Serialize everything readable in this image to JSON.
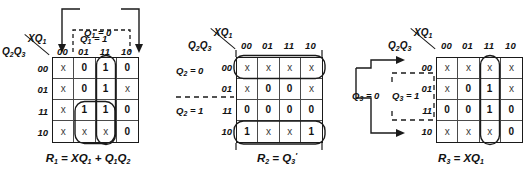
{
  "figure": {
    "col_header_label": "XQ1",
    "row_header_label": "Q2Q3",
    "column_codes": [
      "00",
      "01",
      "11",
      "10"
    ],
    "row_codes": [
      "00",
      "01",
      "11",
      "10"
    ]
  },
  "maps": [
    {
      "id": "kmap-1",
      "name": "R1",
      "corner_top": "XQ",
      "corner_top_sub": "1",
      "corner_bottom": "Q",
      "corner_bottom_subs": "2Q3",
      "columns": [
        "00",
        "01",
        "11",
        "10"
      ],
      "rows": [
        "00",
        "01",
        "11",
        "10"
      ],
      "cells": [
        [
          "x",
          "0",
          "1",
          "0"
        ],
        [
          "x",
          "0",
          "1",
          "x"
        ],
        [
          "x",
          "1",
          "1",
          "0"
        ],
        [
          "x",
          "x",
          "x",
          "0"
        ]
      ],
      "equation": "R1 = XQ1 + Q1Q2",
      "annotations": {
        "top_solid_label": "Q1 = 0",
        "top_dashed_label": "Q1 = 1"
      },
      "groups": [
        {
          "name": "group-column-11",
          "cols": [
            2,
            2
          ],
          "rows": [
            0,
            3
          ]
        },
        {
          "name": "group-row-11-10-cols-01-11",
          "cols": [
            1,
            2
          ],
          "rows": [
            2,
            3
          ]
        }
      ]
    },
    {
      "id": "kmap-2",
      "name": "R2",
      "corner_top": "XQ",
      "corner_top_sub": "1",
      "corner_bottom": "Q",
      "corner_bottom_subs": "2Q3",
      "columns": [
        "00",
        "01",
        "11",
        "10"
      ],
      "rows": [
        "00",
        "01",
        "11",
        "10"
      ],
      "cells": [
        [
          "x",
          "x",
          "x",
          "x"
        ],
        [
          "x",
          "0",
          "0",
          "x"
        ],
        [
          "0",
          "0",
          "0",
          "0"
        ],
        [
          "1",
          "x",
          "x",
          "1"
        ]
      ],
      "equation": "R2 = Q3'",
      "annotations": {
        "left_upper_label": "Q2 = 0",
        "left_lower_label": "Q2 = 1"
      },
      "groups": [
        {
          "name": "group-row-00",
          "cols": [
            0,
            3
          ],
          "rows": [
            0,
            0
          ]
        },
        {
          "name": "group-row-10",
          "cols": [
            0,
            3
          ],
          "rows": [
            3,
            3
          ]
        }
      ]
    },
    {
      "id": "kmap-3",
      "name": "R3",
      "corner_top": "XQ",
      "corner_top_sub": "1",
      "corner_bottom": "Q",
      "corner_bottom_subs": "2Q3",
      "columns": [
        "00",
        "01",
        "11",
        "10"
      ],
      "rows": [
        "00",
        "01",
        "11",
        "10"
      ],
      "cells": [
        [
          "x",
          "x",
          "x",
          "x"
        ],
        [
          "x",
          "0",
          "1",
          "x"
        ],
        [
          "0",
          "0",
          "1",
          "0"
        ],
        [
          "x",
          "x",
          "x",
          "0"
        ]
      ],
      "equation": "R3 = XQ1",
      "annotations": {
        "left_solid_label": "Q3 = 0",
        "left_dashed_label": "Q3 = 1"
      },
      "groups": [
        {
          "name": "group-column-11",
          "cols": [
            2,
            2
          ],
          "rows": [
            0,
            3
          ]
        }
      ]
    }
  ],
  "equations": {
    "r1": "R1 = XQ1 + Q1Q2",
    "r2": "R2 = Q3'",
    "r3": "R3 = XQ1"
  },
  "colors": {
    "ink": "#111111",
    "grid_line": "#4a4a4a",
    "grid_border": "#1a1a1a",
    "background": "#ffffff"
  }
}
